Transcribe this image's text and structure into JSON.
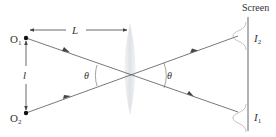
{
  "diagram": {
    "labels": {
      "screen": "Screen",
      "distance": "L",
      "separation": "l",
      "angle_left": "θ",
      "angle_right": "θ"
    },
    "sources": [
      {
        "name": "O",
        "sub": "1"
      },
      {
        "name": "O",
        "sub": "2"
      }
    ],
    "images": [
      {
        "name": "I",
        "sub": "2"
      },
      {
        "name": "I",
        "sub": "1"
      }
    ],
    "colors": {
      "line": "#555555",
      "lens": "#e6e8ea",
      "text": "#333333",
      "dot": "#111111"
    }
  }
}
